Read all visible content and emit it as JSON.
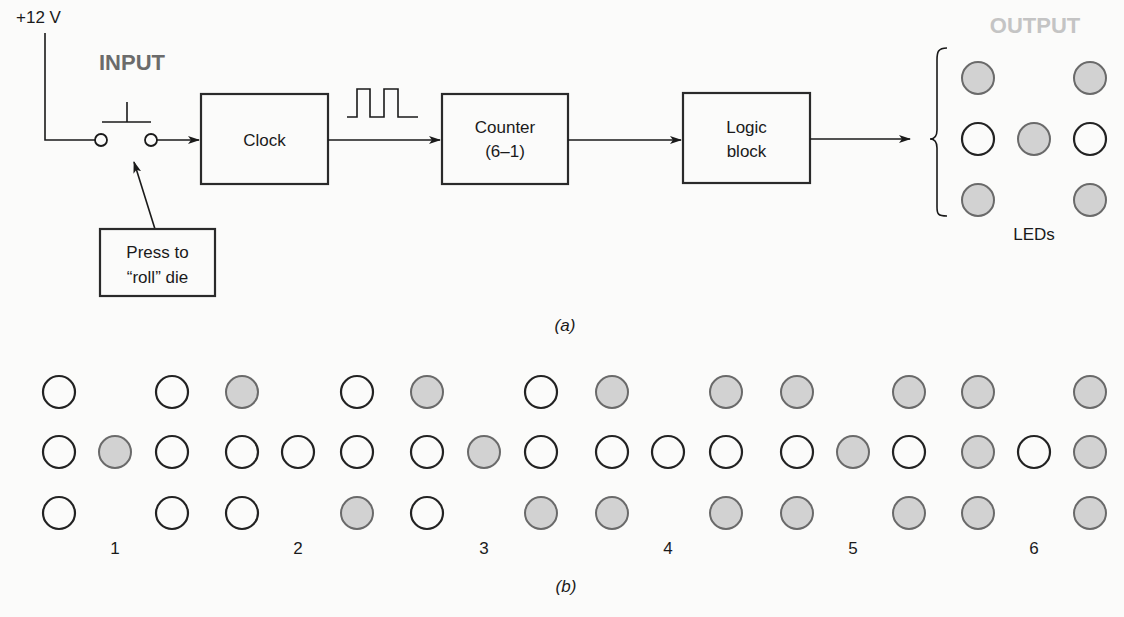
{
  "figure_a": {
    "caption": "(a)",
    "supply_label": "+12 V",
    "input_heading": "INPUT",
    "output_heading": "OUTPUT",
    "input_heading_color": "#6b6b6b",
    "output_heading_color": "#c4c4c4",
    "switch_note_line1": "Press to",
    "switch_note_line2": "“roll” die",
    "blocks": [
      {
        "id": "clock",
        "line1": "Clock",
        "line2": ""
      },
      {
        "id": "counter",
        "line1": "Counter",
        "line2": "(6–1)"
      },
      {
        "id": "logic",
        "line1": "Logic",
        "line2": "block"
      }
    ],
    "led_label": "LEDs",
    "output_display": {
      "value": 5,
      "grid": [
        [
          1,
          0,
          1
        ],
        [
          0,
          1,
          0
        ],
        [
          1,
          0,
          1
        ]
      ]
    }
  },
  "figure_b": {
    "caption": "(b)",
    "patterns": [
      {
        "label": "1",
        "grid": [
          [
            0,
            0,
            0
          ],
          [
            0,
            1,
            0
          ],
          [
            0,
            0,
            0
          ]
        ]
      },
      {
        "label": "2",
        "grid": [
          [
            1,
            0,
            0
          ],
          [
            0,
            0,
            0
          ],
          [
            0,
            0,
            1
          ]
        ]
      },
      {
        "label": "3",
        "grid": [
          [
            1,
            0,
            0
          ],
          [
            0,
            1,
            0
          ],
          [
            0,
            0,
            1
          ]
        ]
      },
      {
        "label": "4",
        "grid": [
          [
            1,
            0,
            1
          ],
          [
            0,
            0,
            0
          ],
          [
            1,
            0,
            1
          ]
        ]
      },
      {
        "label": "5",
        "grid": [
          [
            1,
            0,
            1
          ],
          [
            0,
            1,
            0
          ],
          [
            1,
            0,
            1
          ]
        ]
      },
      {
        "label": "6",
        "grid": [
          [
            1,
            0,
            1
          ],
          [
            1,
            0,
            1
          ],
          [
            1,
            0,
            1
          ]
        ]
      }
    ]
  },
  "colors": {
    "led_on_fill": "#d2d2d2",
    "led_on_stroke": "#6a6a6a",
    "led_off_stroke": "#222222",
    "background": "#fbfbfa"
  }
}
